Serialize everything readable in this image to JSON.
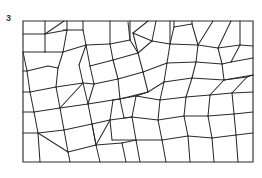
{
  "figure": {
    "label": "3",
    "caption_number": "3",
    "kind": "polygon-tessellation-diagram",
    "line_color": "#2b2b2b",
    "frame_color": "#2f2f2f",
    "background_color": "#ffffff",
    "label_color": "#3a3a3a"
  },
  "frame": {
    "x": 23,
    "y": 21,
    "width": 230,
    "height": 141,
    "path": "M23,21 L253,21 L253,162 L23,162 Z"
  },
  "tessellation": {
    "edge_count": 96,
    "edges": [
      "M23,34 L45,34",
      "M45,21 L45,34",
      "M45,34 L45,52",
      "M23,52 L45,52",
      "M45,34 L64,21",
      "M45,34 L67,30",
      "M67,21 L67,30",
      "M67,30 L63,52",
      "M45,52 L63,52",
      "M63,30 L83,30",
      "M83,21 L83,30",
      "M83,30 L86,45",
      "M63,52 L86,45",
      "M86,45 L79,65",
      "M63,52 L58,68",
      "M23,52 L27,71",
      "M23,71 L27,71",
      "M27,71 L48,66",
      "M48,66 L58,68",
      "M86,45 L110,44",
      "M110,21 L110,44",
      "M110,44 L130,40",
      "M130,21 L130,40",
      "M130,40 L128,22",
      "M110,44 L113,60",
      "M86,45 L90,66",
      "M90,66 L113,60",
      "M113,60 L138,53",
      "M130,40 L138,53",
      "M138,53 L133,33",
      "M133,33 L148,21",
      "M133,33 L152,41",
      "M138,53 L152,41",
      "M152,41 L156,21",
      "M152,41 L170,44",
      "M170,21 L170,44",
      "M170,44 L174,27",
      "M174,21 L174,27",
      "M174,27 L192,24",
      "M192,21 L192,24",
      "M192,24 L198,45",
      "M170,44 L198,45",
      "M198,45 L213,21",
      "M198,45 L218,48",
      "M218,48 L231,21",
      "M218,48 L240,45",
      "M240,21 L240,45",
      "M240,45 L253,46",
      "M218,48 L222,64",
      "M198,45 L196,62",
      "M196,62 L222,64",
      "M222,64 L231,62",
      "M231,62 L253,58",
      "M240,45 L231,62",
      "M222,64 L224,80",
      "M196,62 L192,78",
      "M192,78 L224,80",
      "M224,80 L253,75",
      "M170,44 L167,63",
      "M167,63 L196,62",
      "M167,63 L164,82",
      "M164,82 L192,78",
      "M138,53 L143,72",
      "M143,72 L167,63",
      "M143,72 L148,92",
      "M148,92 L164,82",
      "M113,60 L118,79",
      "M118,79 L143,72",
      "M118,79 L120,99",
      "M120,99 L148,92",
      "M90,66 L94,84",
      "M94,84 L118,79",
      "M79,65 L83,83",
      "M83,83 L94,84",
      "M58,68 L56,87",
      "M56,87 L83,83",
      "M27,71 L30,92",
      "M23,92 L30,92",
      "M30,92 L56,87",
      "M56,87 L60,108",
      "M30,92 L34,112",
      "M23,112 L34,112",
      "M34,112 L60,108",
      "M60,108 L83,83",
      "M83,83 L88,104",
      "M88,104 L60,108",
      "M88,104 L94,84",
      "M88,104 L113,100",
      "M120,99 L113,100",
      "M113,100 L110,120",
      "M88,104 L92,124",
      "M92,124 L110,120",
      "M60,108 L64,130",
      "M34,112 L38,133",
      "M23,133 L38,133",
      "M38,133 L64,130",
      "M64,130 L92,124",
      "M64,130 L68,152",
      "M38,133 L40,162",
      "M68,152 L70,162",
      "M38,133 L68,152",
      "M92,124 L96,145",
      "M96,145 L68,152",
      "M96,145 L110,120",
      "M110,120 L132,117",
      "M113,100 L136,96",
      "M120,99 L124,118",
      "M124,118 L132,117",
      "M132,117 L136,96",
      "M136,96 L148,92",
      "M136,96 L160,100",
      "M160,100 L164,82",
      "M160,100 L158,120",
      "M132,117 L158,120",
      "M158,120 L162,140",
      "M132,117 L136,140",
      "M136,140 L162,140",
      "M96,145 L100,162",
      "M96,145 L122,143",
      "M122,143 L136,140",
      "M122,143 L126,162",
      "M136,140 L140,162",
      "M162,140 L166,162",
      "M162,140 L188,136",
      "M158,120 L184,116",
      "M184,116 L188,136",
      "M160,100 L186,97",
      "M186,97 L184,116",
      "M186,97 L192,78",
      "M186,97 L210,95",
      "M210,95 L224,80",
      "M210,95 L208,116",
      "M184,116 L208,116",
      "M208,116 L212,138",
      "M188,136 L212,138",
      "M188,136 L190,162",
      "M212,138 L214,162",
      "M212,138 L236,135",
      "M208,116 L234,114",
      "M234,114 L236,135",
      "M236,135 L253,133",
      "M234,114 L253,112",
      "M210,95 L232,93",
      "M232,93 L234,114",
      "M232,93 L253,92",
      "M224,80 L247,77",
      "M247,77 L253,75",
      "M247,77 L232,93",
      "M236,135 L238,162",
      "M110,120 L112,140",
      "M112,140 L136,140",
      "M92,124 L96,145"
    ]
  }
}
